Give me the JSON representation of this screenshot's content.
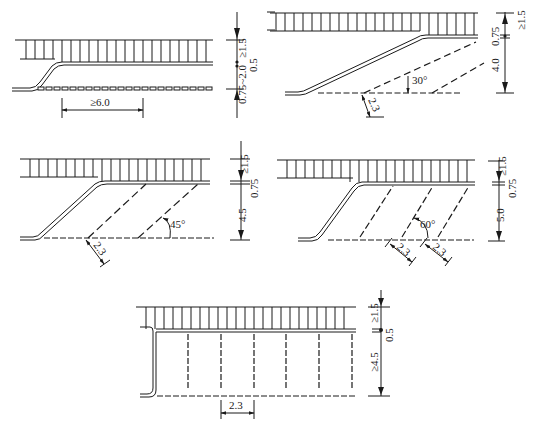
{
  "diagram": {
    "type": "parking-stall-layouts",
    "panels": [
      {
        "id": "parallel",
        "angle_label": "",
        "dims": {
          "top": "≥1.5",
          "mid": "0.5",
          "bottom": "0.75~2.0",
          "horizontal": "≥6.0"
        }
      },
      {
        "id": "angle-30",
        "angle_label": "30°",
        "dims": {
          "top": "≥1.5",
          "mid": "0.75",
          "bottom": "4.0",
          "stall_width": "2.3"
        }
      },
      {
        "id": "angle-45",
        "angle_label": "45°",
        "dims": {
          "top": "≥1.5",
          "mid": "0.75",
          "bottom": "4.5",
          "stall_width": "2.3"
        }
      },
      {
        "id": "angle-60",
        "angle_label": "60°",
        "dims": {
          "top": "≥1.5",
          "mid": "0.75",
          "bottom": "5.0",
          "stall_width_1": "2.3",
          "stall_width_2": "2.3"
        }
      },
      {
        "id": "perpendicular",
        "angle_label": "",
        "dims": {
          "top": "≥1.5",
          "mid": "0.5",
          "bottom": "≥4.5",
          "stall_width": "2.3"
        }
      }
    ]
  }
}
